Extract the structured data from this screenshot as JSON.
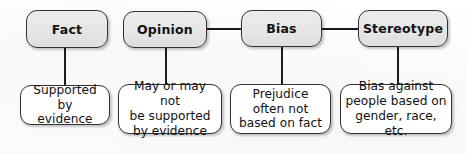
{
  "diagram": {
    "type": "flow-chart",
    "colors": {
      "background": "#fdfdfd",
      "top_node_fill": "#e8e8e8",
      "bottom_node_fill": "#ffffff",
      "border": "#333333",
      "connector": "#1c1c1c",
      "text": "#121212"
    },
    "top_nodes": [
      {
        "id": "fact",
        "label": "Fact"
      },
      {
        "id": "opinion",
        "label": "Opinion"
      },
      {
        "id": "bias",
        "label": "Bias"
      },
      {
        "id": "stereotype",
        "label": "Stereotype"
      }
    ],
    "bottom_nodes": [
      {
        "id": "fact-detail",
        "label": "Supported by\nevidence"
      },
      {
        "id": "opinion-detail",
        "label": "May or may not\nbe supported\nby evidence"
      },
      {
        "id": "bias-detail",
        "label": "Prejudice\noften not\nbased on fact"
      },
      {
        "id": "stereotype-detail",
        "label": "Bias against\npeople based on\ngender, race, etc."
      }
    ],
    "connectors": [
      {
        "id": "opinion-to-bias",
        "from": "opinion",
        "to": "bias",
        "orientation": "horizontal"
      },
      {
        "id": "bias-to-stereotype",
        "from": "bias",
        "to": "stereotype",
        "orientation": "horizontal"
      },
      {
        "id": "fact-to-detail",
        "from": "fact",
        "to": "fact-detail",
        "orientation": "vertical"
      },
      {
        "id": "opinion-to-detail",
        "from": "opinion",
        "to": "opinion-detail",
        "orientation": "vertical"
      },
      {
        "id": "bias-to-detail",
        "from": "bias",
        "to": "bias-detail",
        "orientation": "vertical"
      },
      {
        "id": "stereotype-to-detail",
        "from": "stereotype",
        "to": "stereotype-detail",
        "orientation": "vertical"
      }
    ]
  }
}
